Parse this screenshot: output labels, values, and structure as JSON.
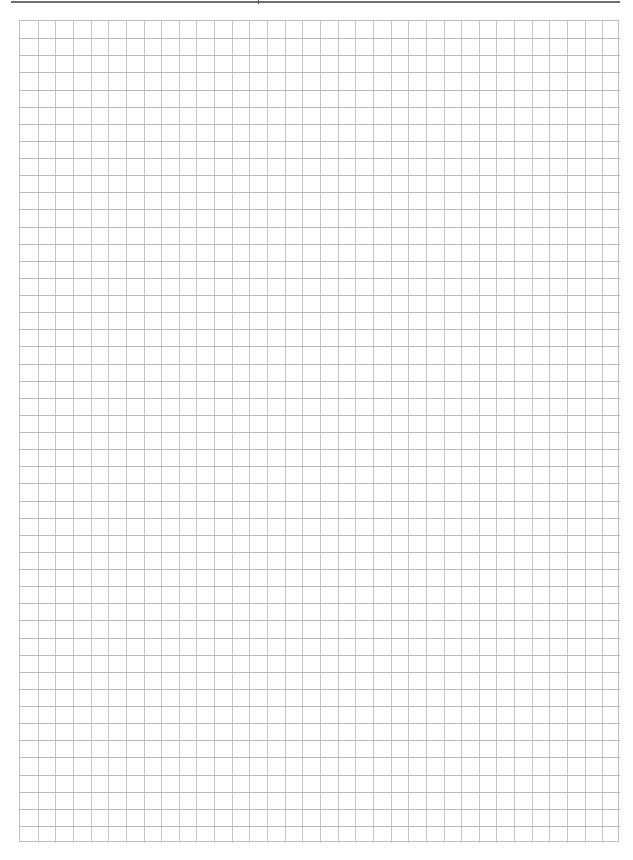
{
  "page": {
    "type": "graph-paper",
    "background_color": "#ffffff",
    "header_rule_color": "#6e6e6e",
    "grid_line_color": "#c4c4c4",
    "grid_border_color": "#bdbdbd",
    "grid": {
      "columns": 34,
      "rows": 48,
      "cell_width_px": 17.65,
      "cell_height_px": 17.12
    }
  }
}
